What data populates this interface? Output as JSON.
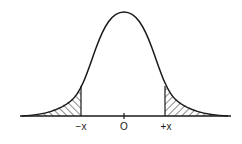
{
  "diagram": {
    "type": "normal-distribution-curve",
    "axis_labels": {
      "left": "−x",
      "center": "O",
      "right": "+x"
    },
    "colors": {
      "line": "#1a1a1a",
      "background": "#ffffff"
    },
    "shaded_regions": [
      "left-tail",
      "right-tail"
    ]
  }
}
